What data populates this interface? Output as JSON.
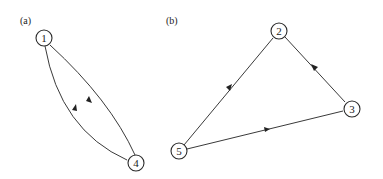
{
  "panels": [
    {
      "label": "(a)",
      "nodes": [
        {
          "id": "1",
          "label": "1"
        },
        {
          "id": "4",
          "label": "4"
        }
      ],
      "edges": [
        {
          "from": "1",
          "to": "4",
          "shape": "curved-left"
        },
        {
          "from": "4",
          "to": "1",
          "shape": "curved-right"
        }
      ]
    },
    {
      "label": "(b)",
      "nodes": [
        {
          "id": "2",
          "label": "2"
        },
        {
          "id": "3",
          "label": "3"
        },
        {
          "id": "5",
          "label": "5"
        }
      ],
      "edges": [
        {
          "from": "2",
          "to": "5",
          "shape": "straight"
        },
        {
          "from": "3",
          "to": "2",
          "shape": "straight"
        },
        {
          "from": "5",
          "to": "3",
          "shape": "straight"
        }
      ]
    }
  ],
  "colors": {
    "stroke": "#2a2a2a",
    "background": "#ffffff"
  }
}
